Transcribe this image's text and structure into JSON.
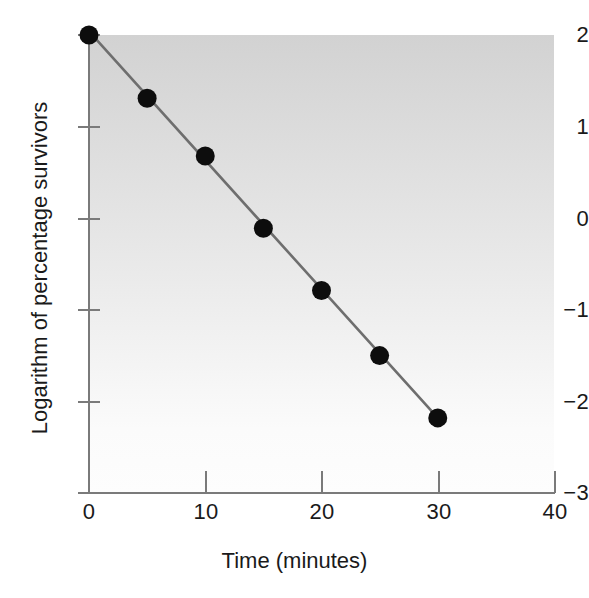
{
  "chart_data": {
    "type": "scatter",
    "title": "",
    "xlabel": "Time (minutes)",
    "ylabel": "Logarithm of percentage survivors",
    "xlim": [
      0,
      40
    ],
    "ylim": [
      -3,
      2
    ],
    "xticks": [
      "0",
      "10",
      "20",
      "30",
      "40"
    ],
    "xtick_values": [
      0,
      10,
      20,
      30,
      40
    ],
    "yticks": [
      "2",
      "1",
      "0",
      "−1",
      "−2",
      "−3"
    ],
    "ytick_values": [
      2,
      1,
      0,
      -1,
      -2,
      -3
    ],
    "grid": false,
    "legend": null,
    "x": [
      0,
      5,
      10,
      15,
      20,
      25,
      30
    ],
    "y": [
      2.0,
      1.31,
      0.68,
      -0.11,
      -0.79,
      -1.5,
      -2.18
    ],
    "series": [
      {
        "name": "percentage survivors",
        "points": [
          {
            "x": 0,
            "y": 2.0
          },
          {
            "x": 5,
            "y": 1.31
          },
          {
            "x": 10,
            "y": 0.68
          },
          {
            "x": 15,
            "y": -0.11
          },
          {
            "x": 20,
            "y": -0.79
          },
          {
            "x": 25,
            "y": -1.5
          },
          {
            "x": 30,
            "y": -2.18
          }
        ],
        "marker": "filled-circle",
        "marker_color": "#0d0d0d",
        "line_color": "#6e6e6e",
        "line_width": 2.6
      }
    ],
    "trendline": {
      "type": "line",
      "from": {
        "x": 0,
        "y": 2.04
      },
      "to": {
        "x": 30,
        "y": -2.18
      },
      "color": "#6e6e6e"
    },
    "colors": {
      "plot_background_top": "#d2d2d2",
      "plot_background_bottom": "#fdfdfd",
      "axis": "#7a7a7a",
      "text": "#1a1a1a",
      "marker": "#0d0d0d",
      "line": "#6e6e6e"
    }
  }
}
